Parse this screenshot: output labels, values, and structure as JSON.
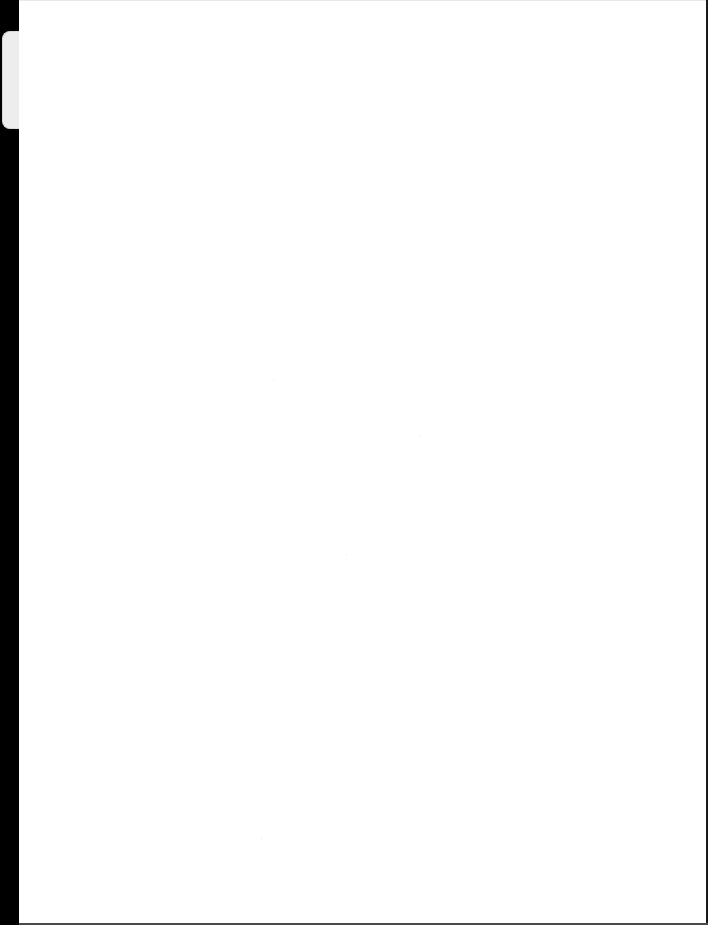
{
  "document": {
    "type": "scanned-page",
    "content": "",
    "colors": {
      "page": "#ffffff",
      "scan_border": "#000000",
      "tab": "#ededed"
    }
  }
}
